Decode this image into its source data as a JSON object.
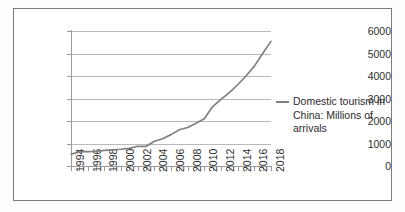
{
  "figure": {
    "background_color": "#fdfdfd",
    "frame_color": "#7c7c7c",
    "plot_background": "#ffffff"
  },
  "legend": {
    "position": "right",
    "marker": "line-dash",
    "label": "Domestic tourism in\nChina: Millions of arrivals",
    "label_line1": "Domestic tourism in",
    "label_line2": "China: Millions of arrivals",
    "line_color": "#808080"
  },
  "axes": {
    "y_ticks": [
      "6000",
      "5000",
      "4000",
      "3000",
      "2000",
      "1000",
      "0"
    ],
    "x_ticks": [
      "1994",
      "1996",
      "1998",
      "2000",
      "2002",
      "2004",
      "2006",
      "2008",
      "2010",
      "2012",
      "2014",
      "2016",
      "2018"
    ],
    "grid_color": "#b9b9b9",
    "axis_color": "#9a9a9a"
  },
  "chart_data": {
    "type": "line",
    "title": "",
    "xlabel": "",
    "ylabel": "",
    "ylim": [
      0,
      6000
    ],
    "xlim": [
      1994,
      2018
    ],
    "grid": true,
    "legend_position": "right",
    "x": [
      1994,
      1995,
      1996,
      1997,
      1998,
      1999,
      2000,
      2001,
      2002,
      2003,
      2004,
      2005,
      2006,
      2007,
      2008,
      2009,
      2010,
      2011,
      2012,
      2013,
      2014,
      2015,
      2016,
      2017,
      2018
    ],
    "series": [
      {
        "name": "Domestic tourism in China: Millions of arrivals",
        "color": "#808080",
        "values": [
          524,
          629,
          640,
          644,
          695,
          719,
          744,
          784,
          878,
          870,
          1102,
          1212,
          1394,
          1610,
          1712,
          1902,
          2103,
          2641,
          2957,
          3262,
          3611,
          4000,
          4440,
          5001,
          5539
        ]
      }
    ]
  }
}
